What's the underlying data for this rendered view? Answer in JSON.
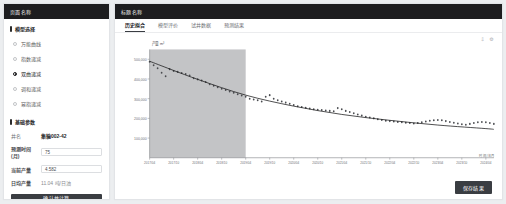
{
  "sidebar": {
    "header_title": "页面名称",
    "section_model": {
      "title": "模型选择",
      "options": [
        {
          "label": "万能曲线",
          "selected": false
        },
        {
          "label": "指数递减",
          "selected": false
        },
        {
          "label": "双曲递减",
          "selected": true
        },
        {
          "label": "调和递减",
          "selected": false
        },
        {
          "label": "幂指递减",
          "selected": false
        }
      ]
    },
    "section_params": {
      "title": "基础参数",
      "rows": [
        {
          "label": "井名",
          "value": "集输002-42",
          "type": "static"
        },
        {
          "label": "预测时间(月)",
          "value": "75",
          "type": "input",
          "placeholder": "请输入预测时间"
        },
        {
          "label": "当前产量",
          "value": "4.582",
          "type": "input",
          "placeholder": "请输入当前产量"
        },
        {
          "label": "日均产量",
          "value": "11.04 吨/日油",
          "type": "readonly"
        }
      ]
    },
    "submit_label": "确认并计算"
  },
  "main": {
    "header_title": "标题名称",
    "tabs": [
      {
        "label": "历史拟合",
        "active": true
      },
      {
        "label": "模型评价",
        "active": false
      },
      {
        "label": "试井数据",
        "active": false
      },
      {
        "label": "预测结果",
        "active": false
      }
    ],
    "corner_icons": [
      {
        "name": "export-icon",
        "glyph": "⇩"
      },
      {
        "name": "settings-icon",
        "glyph": "⚙"
      }
    ],
    "submit_label": "保存结果"
  },
  "chart_data": {
    "type": "scatter",
    "title": "",
    "ylabel": "产量 m³",
    "xlabel": "时间/年月",
    "ylim": [
      0,
      550000
    ],
    "yticks": [
      100000,
      200000,
      300000,
      400000,
      500000
    ],
    "ytick_labels": [
      "100,000",
      "200,000",
      "300,000",
      "400,000",
      "500,000"
    ],
    "grid": false,
    "legend": "none",
    "shaded_region": {
      "label": "历史拟合区间",
      "x_start": "2017/04",
      "x_end": "2019/04",
      "color": "#b9babc"
    },
    "xticks": [
      "2017/04",
      "2017/10",
      "2018/04",
      "2018/10",
      "2019/04",
      "2019/10",
      "2020/04",
      "2020/10",
      "2021/04",
      "2021/10",
      "2022/04",
      "2022/10",
      "2023/04",
      "2023/10",
      "2024/04",
      "2024/10"
    ],
    "series": [
      {
        "name": "实际产量",
        "type": "scatter",
        "marker": "dot",
        "color": "#4a4c50",
        "x": [
          "2017/04",
          "2017/05",
          "2017/06",
          "2017/07",
          "2017/08",
          "2017/09",
          "2017/10",
          "2017/11",
          "2017/12",
          "2018/01",
          "2018/02",
          "2018/03",
          "2018/04",
          "2018/05",
          "2018/06",
          "2018/07",
          "2018/08",
          "2018/09",
          "2018/10",
          "2018/11",
          "2018/12",
          "2019/01",
          "2019/02",
          "2019/03",
          "2019/04",
          "2019/05",
          "2019/06",
          "2019/07",
          "2019/08",
          "2019/09",
          "2019/10",
          "2019/11",
          "2019/12",
          "2020/01",
          "2020/02",
          "2020/03",
          "2020/04",
          "2020/05",
          "2020/06",
          "2020/07",
          "2020/08",
          "2020/09",
          "2020/10",
          "2020/11",
          "2020/12",
          "2021/01",
          "2021/02",
          "2021/03",
          "2021/04",
          "2021/05",
          "2021/06",
          "2021/07",
          "2021/08",
          "2021/09",
          "2021/10",
          "2021/11",
          "2021/12",
          "2022/01",
          "2022/02",
          "2022/03",
          "2022/04",
          "2022/05",
          "2022/06",
          "2022/07",
          "2022/08",
          "2022/09",
          "2022/10",
          "2022/11",
          "2022/12",
          "2023/01",
          "2023/02",
          "2023/03",
          "2023/04",
          "2023/05",
          "2023/06",
          "2023/07",
          "2023/08",
          "2023/09",
          "2023/10",
          "2023/11",
          "2023/12",
          "2024/01",
          "2024/02",
          "2024/03",
          "2024/04",
          "2024/05",
          "2024/06"
        ],
        "y": [
          487000,
          470000,
          455000,
          432000,
          414000,
          450000,
          441000,
          436000,
          430000,
          425000,
          418000,
          404000,
          398000,
          392000,
          385000,
          373000,
          366000,
          358000,
          350000,
          344000,
          336000,
          330000,
          322000,
          316000,
          310000,
          300000,
          296000,
          292000,
          286000,
          310000,
          318000,
          300000,
          292000,
          286000,
          280000,
          274000,
          268000,
          262000,
          258000,
          254000,
          250000,
          246000,
          244000,
          242000,
          240000,
          238000,
          236000,
          252000,
          246000,
          238000,
          232000,
          226000,
          220000,
          214000,
          208000,
          204000,
          200000,
          196000,
          192000,
          188000,
          186000,
          184000,
          182000,
          180000,
          178000,
          176000,
          174000,
          176000,
          180000,
          184000,
          188000,
          190000,
          192000,
          190000,
          186000,
          182000,
          178000,
          174000,
          170000,
          168000,
          172000,
          176000,
          180000,
          182000,
          180000,
          176000,
          172000
        ]
      },
      {
        "name": "拟合递减曲线",
        "type": "line",
        "color": "#1d1d1f",
        "x": [
          "2017/04",
          "2018/04",
          "2019/04",
          "2020/04",
          "2021/04",
          "2022/04",
          "2023/04",
          "2024/04",
          "2024/06"
        ],
        "y": [
          490000,
          398000,
          318000,
          262000,
          220000,
          190000,
          166000,
          148000,
          144000
        ]
      }
    ]
  }
}
